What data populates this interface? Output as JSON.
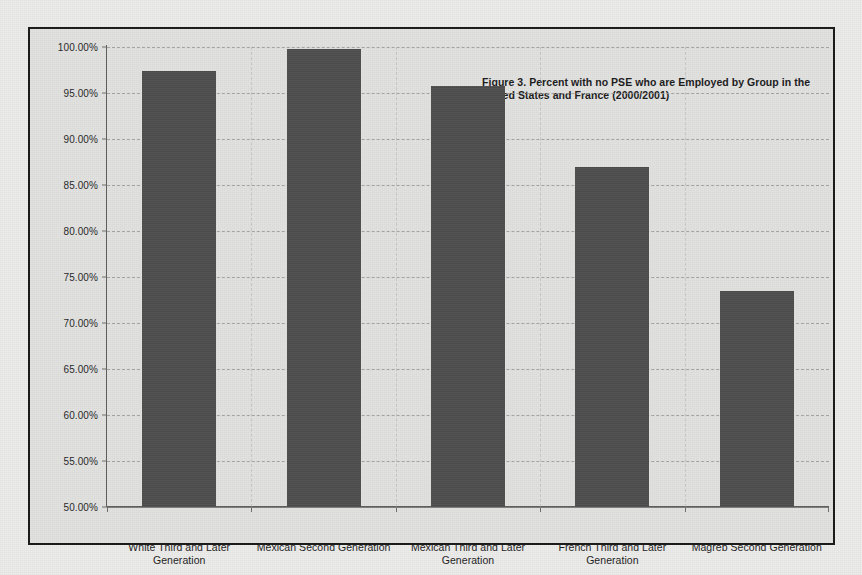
{
  "chart_data": {
    "type": "bar",
    "title": "Figure 3. Percent  with no PSE who are Employed  by Group in the United States and France (2000/2001)",
    "title_line1": "Figure 3. Percent  with no PSE who are Employed  by Group in the",
    "title_line2": "United States and France (2000/2001)",
    "xlabel": "",
    "ylabel": "",
    "ylim": [
      50,
      100
    ],
    "ytick_step": 5,
    "grid": true,
    "legend": "none",
    "bar_color": "#4b4b4b",
    "plot_background": "#e2e2e1",
    "categories": [
      "White Third and Later Generation",
      "Mexican Second Generation",
      "Mexican Third and Later Generation",
      "French Third and Later Generation",
      "Magreb Second Generation"
    ],
    "category_lines": [
      [
        "White Third and Later",
        "Generation"
      ],
      [
        "Mexican Second Generation"
      ],
      [
        "Mexican Third and Later",
        "Generation"
      ],
      [
        "French Third and Later",
        "Generation"
      ],
      [
        "Magreb Second Generation"
      ]
    ],
    "values": [
      97.4,
      99.8,
      95.8,
      87.0,
      73.5
    ],
    "ytick_labels": [
      "100.00%",
      "95.00%",
      "90.00%",
      "85.00%",
      "80.00%",
      "75.00%",
      "70.00%",
      "65.00%",
      "60.00%",
      "55.00%",
      "50.00%"
    ],
    "ytick_values": [
      100,
      95,
      90,
      85,
      80,
      75,
      70,
      65,
      60,
      55,
      50
    ]
  }
}
